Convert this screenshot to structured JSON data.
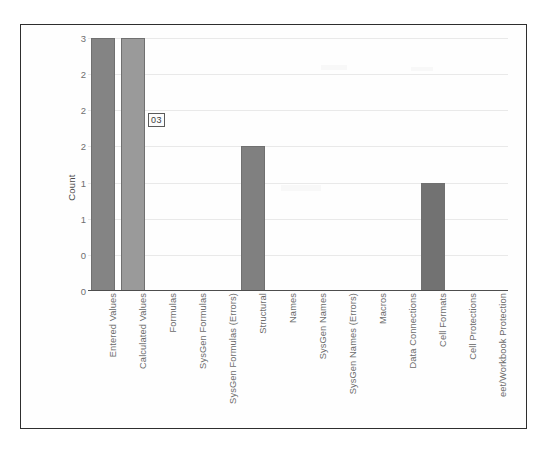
{
  "chart_data": {
    "type": "bar",
    "title": "",
    "subtitle": "",
    "xlabel": "",
    "ylabel": "Count",
    "ylim": [
      0,
      3.5
    ],
    "grid": true,
    "legend": "none",
    "categories": [
      "Entered Values",
      "Calculated Values",
      "Formulas",
      "SysGen Formulas",
      "SysGen Formulas (Errors)",
      "Structural",
      "Names",
      "SysGen Names",
      "SysGen Names (Errors)",
      "Macros",
      "Data Connections",
      "Cell Formats",
      "Cell Protections",
      "eet/Workbook Protection"
    ],
    "values": [
      3.5,
      3.5,
      0,
      0,
      0,
      2,
      0,
      0,
      0,
      0,
      0,
      1.5,
      0,
      0
    ],
    "ytick_labels": [
      "3",
      "2",
      "2",
      "2",
      "1",
      "1",
      "0",
      "0"
    ],
    "ytick_values": [
      3.5,
      3.0,
      2.5,
      2.0,
      1.5,
      1.0,
      0.5,
      0.0
    ],
    "bar_colors": [
      "#848484",
      "#9a9a9a",
      "",
      "",
      "",
      "#808080",
      "",
      "",
      "",
      "",
      "",
      "#727272",
      "",
      ""
    ],
    "data_label": {
      "text": "03",
      "for_category": "Calculated Values"
    }
  },
  "frame": {
    "border_color": "#2e2e2e",
    "background": "#fefefe"
  },
  "axes": {
    "baseline_color": "#4d4d4d",
    "gridline_color": "#e9e9e9",
    "tick_text_color": "#6e6e6e"
  }
}
